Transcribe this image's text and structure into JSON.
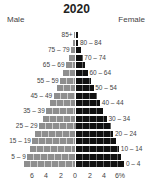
{
  "chart_data": {
    "type": "bar",
    "subtype": "population-pyramid",
    "title": "2020",
    "left_label": "Male",
    "right_label": "Female",
    "categories": [
      "0 – 4",
      "5 – 9",
      "10 – 14",
      "15 – 19",
      "20 – 24",
      "25 – 29",
      "30 – 34",
      "35 – 39",
      "40 – 44",
      "45 – 49",
      "50 – 54",
      "55 – 59",
      "60 – 64",
      "65 – 69",
      "70 – 74",
      "75 – 79",
      "80 – 84",
      "85+"
    ],
    "series": [
      {
        "name": "Male",
        "color": "#8e8e8e",
        "values": [
          7.0,
          6.6,
          6.3,
          5.9,
          5.5,
          5.0,
          4.5,
          4.0,
          3.5,
          3.0,
          2.6,
          2.1,
          1.7,
          1.3,
          0.9,
          0.6,
          0.3,
          0.2
        ]
      },
      {
        "name": "Female",
        "color": "#111111",
        "values": [
          6.7,
          6.3,
          6.0,
          5.6,
          5.2,
          4.8,
          4.3,
          3.8,
          3.4,
          2.9,
          2.5,
          2.1,
          1.7,
          1.3,
          1.0,
          0.7,
          0.4,
          0.3
        ]
      }
    ],
    "xlabel": "",
    "ylabel": "",
    "xticks": [
      "6",
      "4",
      "2",
      "0",
      "2",
      "4",
      "6%"
    ],
    "xlim": [
      -7,
      7
    ],
    "grid": false,
    "legend": "side labels (Male left, Female right)"
  },
  "axis": {
    "ticks": [
      "6",
      "4",
      "2",
      "0",
      "2",
      "4",
      "6%"
    ]
  }
}
